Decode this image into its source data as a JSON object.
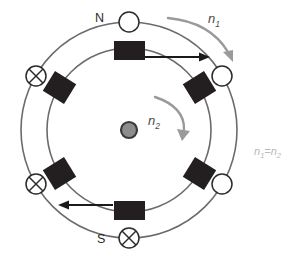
{
  "figure": {
    "type": "technical-diagram",
    "canvas": {
      "width": 299,
      "height": 264,
      "background": "#ffffff"
    },
    "center": {
      "x": 129,
      "y": 130
    }
  },
  "labels": {
    "pole_north": "N",
    "pole_south": "S",
    "outer_speed": "n",
    "outer_speed_sub": "1",
    "inner_speed": "n",
    "inner_speed_sub": "2",
    "relation_lhs": "n",
    "relation_lhs_sub": "1",
    "relation_eq": "=",
    "relation_rhs": "n",
    "relation_rhs_sub": "2"
  },
  "colors": {
    "ring_stroke": "#6b6b6b",
    "marker_stroke": "#2b2b2b",
    "magnet_fill": "#231f20",
    "hub_fill": "#8c8c8c",
    "hub_stroke": "#3a3a3a",
    "force_arrow": "#1a1a1a",
    "rotation_arrow": "#9a9a9a",
    "relation_text": "#b9b9b9",
    "background": "#ffffff"
  },
  "rings": {
    "outer": {
      "name": "outer-rotor-ring",
      "radius": 108,
      "cx": 129,
      "cy": 130
    },
    "inner": {
      "name": "inner-rotor-ring",
      "radius": 82,
      "cx": 129,
      "cy": 130
    }
  },
  "hub": {
    "name": "center-shaft",
    "radius": 9,
    "cx": 129,
    "cy": 130
  },
  "outer_markers": [
    {
      "id": "marker-north-top",
      "kind": "circle-open",
      "angle_deg": -90,
      "cx": 129,
      "cy": 22,
      "r": 10
    },
    {
      "id": "marker-upper-right",
      "kind": "circle-open",
      "angle_deg": -30,
      "cx": 222,
      "cy": 76,
      "r": 10
    },
    {
      "id": "marker-lower-right",
      "kind": "circle-open",
      "angle_deg": 30,
      "cx": 222,
      "cy": 184,
      "r": 10
    },
    {
      "id": "marker-south-bottom",
      "kind": "circle-crossed",
      "angle_deg": 90,
      "cx": 129,
      "cy": 238,
      "r": 10
    },
    {
      "id": "marker-lower-left",
      "kind": "circle-crossed",
      "angle_deg": 150,
      "cx": 36,
      "cy": 184,
      "r": 10
    },
    {
      "id": "marker-upper-left",
      "kind": "circle-crossed",
      "angle_deg": 210,
      "cx": 36,
      "cy": 76,
      "r": 10
    }
  ],
  "inner_magnets": [
    {
      "id": "magnet-top",
      "angle_deg": -90,
      "cx": 129,
      "cy": 50,
      "w": 30,
      "h": 19,
      "rotation": 0
    },
    {
      "id": "magnet-upper-right",
      "angle_deg": -32,
      "cx": 199,
      "cy": 87,
      "w": 25,
      "h": 22,
      "rotation": -32
    },
    {
      "id": "magnet-lower-right",
      "angle_deg": 32,
      "cx": 199,
      "cy": 173,
      "w": 25,
      "h": 22,
      "rotation": 32
    },
    {
      "id": "magnet-bottom",
      "angle_deg": 90,
      "cx": 129,
      "cy": 211,
      "w": 30,
      "h": 19,
      "rotation": 0
    },
    {
      "id": "magnet-lower-left",
      "angle_deg": 148,
      "cx": 59,
      "cy": 173,
      "w": 25,
      "h": 22,
      "rotation": -32
    },
    {
      "id": "magnet-upper-left",
      "angle_deg": 212,
      "cx": 59,
      "cy": 87,
      "w": 25,
      "h": 22,
      "rotation": 32
    }
  ],
  "force_arrows": [
    {
      "id": "force-arrow-top",
      "direction": "right",
      "x1": 145,
      "y1": 57,
      "x2": 209,
      "y2": 57
    },
    {
      "id": "force-arrow-bottom",
      "direction": "left",
      "x1": 113,
      "y1": 204,
      "x2": 59,
      "y2": 204
    }
  ],
  "rotation_arrows": [
    {
      "id": "rotation-arrow-outer",
      "label_ref": "outer_speed",
      "sense": "clockwise"
    },
    {
      "id": "rotation-arrow-inner",
      "label_ref": "inner_speed",
      "sense": "clockwise"
    }
  ]
}
